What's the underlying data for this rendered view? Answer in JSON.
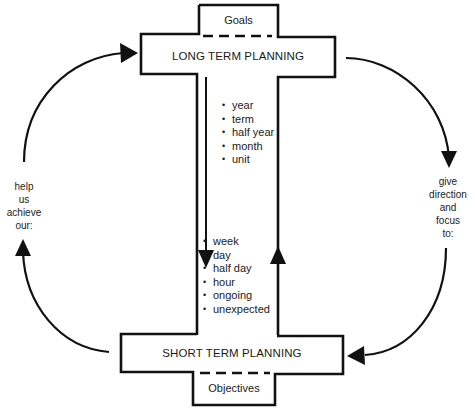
{
  "diagram": {
    "top_block": {
      "tab_label": "Goals",
      "bar_label": "LONG TERM PLANNING",
      "items": [
        "year",
        "term",
        "half year",
        "month",
        "unit"
      ]
    },
    "bottom_block": {
      "tab_label": "Objectives",
      "bar_label": "SHORT TERM PLANNING",
      "items": [
        "week",
        "day",
        "half day",
        "hour",
        "ongoing",
        "unexpected"
      ]
    },
    "left_cycle_label": [
      "help",
      "us",
      "achieve",
      "our:"
    ],
    "right_cycle_label": [
      "give",
      "direction",
      "and",
      "focus",
      "to:"
    ],
    "stroke_color": "#111111",
    "background_color": "#ffffff"
  }
}
